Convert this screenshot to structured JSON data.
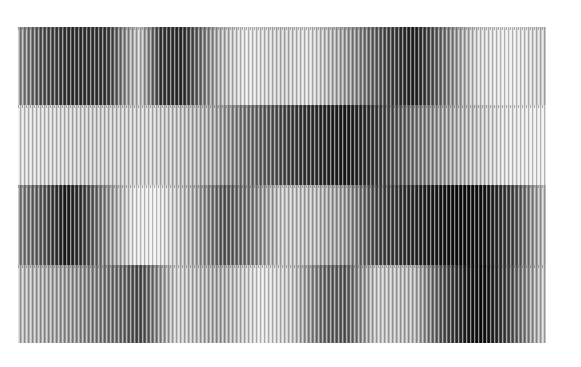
{
  "image": {
    "description": "Grayscale abstract texture of four horizontal bands composed of fine vertical stripes with varying darkness",
    "bands": [
      {
        "top": 0,
        "height": 78,
        "stops": [
          [
            "#9a9a9a",
            0
          ],
          [
            "#5a5a5a",
            4
          ],
          [
            "#2e2e2e",
            10
          ],
          [
            "#3a3a3a",
            17
          ],
          [
            "#a0a0a0",
            21
          ],
          [
            "#c8c8c8",
            23
          ],
          [
            "#3a3a3a",
            27
          ],
          [
            "#2a2a2a",
            31
          ],
          [
            "#b0b0b0",
            38
          ],
          [
            "#e6e6e6",
            43
          ],
          [
            "#cfcfcf",
            50
          ],
          [
            "#e0e0e0",
            55
          ],
          [
            "#a0a0a0",
            62
          ],
          [
            "#4a4a4a",
            70
          ],
          [
            "#1e1e1e",
            75
          ],
          [
            "#6a6a6a",
            80
          ],
          [
            "#d8d8d8",
            87
          ],
          [
            "#eeeeee",
            93
          ],
          [
            "#cfcfcf",
            100
          ]
        ]
      },
      {
        "top": 78,
        "height": 80,
        "stops": [
          [
            "#e2e2e2",
            0
          ],
          [
            "#cccccc",
            15
          ],
          [
            "#d4d4d4",
            25
          ],
          [
            "#b0b0b0",
            36
          ],
          [
            "#808080",
            42
          ],
          [
            "#3a3a3a",
            53
          ],
          [
            "#1a1a1a",
            62
          ],
          [
            "#3a3a3a",
            68
          ],
          [
            "#7a7a7a",
            76
          ],
          [
            "#b4b4b4",
            84
          ],
          [
            "#e4e4e4",
            92
          ],
          [
            "#f0f0f0",
            100
          ]
        ]
      },
      {
        "top": 158,
        "height": 80,
        "stops": [
          [
            "#8a8a8a",
            0
          ],
          [
            "#5a5a5a",
            5
          ],
          [
            "#1a1a1a",
            9
          ],
          [
            "#3a3a3a",
            12
          ],
          [
            "#e8e8e8",
            22
          ],
          [
            "#f2f2f2",
            26
          ],
          [
            "#b0b0b0",
            33
          ],
          [
            "#5a5a5a",
            39
          ],
          [
            "#7a7a7a",
            44
          ],
          [
            "#c8c8c8",
            50
          ],
          [
            "#bcbcbc",
            56
          ],
          [
            "#9a9a9a",
            62
          ],
          [
            "#4a4a4a",
            68
          ],
          [
            "#2a2a2a",
            75
          ],
          [
            "#0a0a0a",
            83
          ],
          [
            "#101010",
            88
          ],
          [
            "#4a4a4a",
            94
          ],
          [
            "#c8c8c8",
            100
          ]
        ]
      },
      {
        "top": 238,
        "height": 78,
        "stops": [
          [
            "#c0c0c0",
            0
          ],
          [
            "#9a9a9a",
            10
          ],
          [
            "#6a6a6a",
            20
          ],
          [
            "#4a4a4a",
            23
          ],
          [
            "#d0d0d0",
            30
          ],
          [
            "#a8a8a8",
            38
          ],
          [
            "#e6e6e6",
            46
          ],
          [
            "#c8c8c8",
            52
          ],
          [
            "#6a6a6a",
            58
          ],
          [
            "#5a5a5a",
            62
          ],
          [
            "#c8c8c8",
            68
          ],
          [
            "#b8b8b8",
            75
          ],
          [
            "#5a5a5a",
            80
          ],
          [
            "#1a1a1a",
            85
          ],
          [
            "#0a0a0a",
            88
          ],
          [
            "#4a4a4a",
            93
          ],
          [
            "#d0d0d0",
            100
          ]
        ]
      }
    ]
  }
}
